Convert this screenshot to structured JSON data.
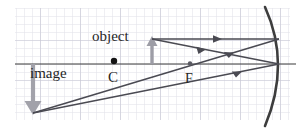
{
  "figure": {
    "kind": "optics-ray-diagram",
    "background_color": "#ffffff",
    "grid": {
      "visible": true,
      "minor_color": "#dcdce4",
      "major_color": "#c9c9d6",
      "minor_spacing_px": 8,
      "major_every": 5,
      "area": {
        "x": 15,
        "y": 8,
        "width": 275,
        "height": 112
      }
    },
    "colors": {
      "axis": "#3a3a3a",
      "mirror": "#3d3d3d",
      "ray": "#4a4a52",
      "object_arrow": "#9a9aa2",
      "image_arrow": "#a0a0a8",
      "point_marker": "#1a1a1a",
      "text": "#262626"
    }
  },
  "labels": {
    "object": "object",
    "image": "image",
    "center_of_curvature": "C",
    "focal_point": "F"
  },
  "elements": {
    "principal_axis": {
      "name": "principal-axis",
      "y": 64,
      "x_start": 15,
      "x_end": 296
    },
    "mirror": {
      "name": "concave-mirror",
      "description": "curved arc bulging right, vertex on axis",
      "vertex_x": 281,
      "top": {
        "x": 265,
        "y": 7
      },
      "bottom": {
        "x": 265,
        "y": 126
      }
    },
    "object_arrow": {
      "name": "object-arrow",
      "direction": "up",
      "base": {
        "x": 152,
        "y": 64
      },
      "tip": {
        "x": 152,
        "y": 39
      }
    },
    "image_arrow": {
      "name": "image-arrow",
      "direction": "down",
      "base": {
        "x": 33,
        "y": 64
      },
      "tip": {
        "x": 33,
        "y": 113
      }
    },
    "point_c": {
      "name": "center-of-curvature-point",
      "x": 114,
      "y": 62
    },
    "point_f": {
      "name": "focal-point",
      "x": 190,
      "y": 64
    },
    "rays": [
      {
        "name": "parallel-incident-ray",
        "from": {
          "x": 152,
          "y": 39
        },
        "to": {
          "x": 279,
          "y": 39
        },
        "arrow_at": 0.55
      },
      {
        "name": "reflected-through-focus-ray",
        "from": {
          "x": 279,
          "y": 39
        },
        "to": {
          "x": 33,
          "y": 113
        },
        "arrow_at": 0.25
      },
      {
        "name": "through-focus-incident-ray",
        "from": {
          "x": 152,
          "y": 39
        },
        "to": {
          "x": 279,
          "y": 64
        },
        "arrow_at": 0.42
      },
      {
        "name": "reflected-parallel-ray",
        "from": {
          "x": 279,
          "y": 64
        },
        "to": {
          "x": 33,
          "y": 113
        },
        "arrow_at": 0.28
      }
    ]
  }
}
